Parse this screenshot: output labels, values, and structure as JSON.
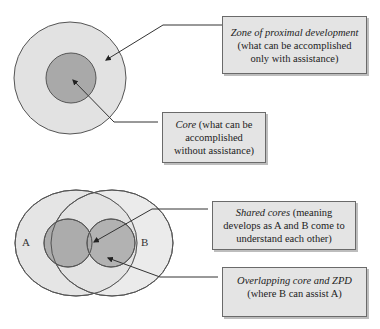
{
  "diagram": {
    "top": {
      "outer_circle_label": "Zone of proximal development",
      "inner_circle_label": "Core",
      "callouts": [
        {
          "term": "Zone of proximal development",
          "description": " (what can be accomplished only with assistance)"
        },
        {
          "term": "Core",
          "description": " (what can be accomplished without assistance)"
        }
      ]
    },
    "bottom": {
      "circle_labels": {
        "a": "A",
        "b": "B"
      },
      "callouts": [
        {
          "term": "Shared cores",
          "description": " (meaning develops as A and B come to understand each other)"
        },
        {
          "term": "Overlapping core and ZPD",
          "description": " (where B can assist A)"
        }
      ]
    },
    "colors": {
      "outer_fill": "#e2e2e2",
      "inner_fill": "#a9a9a9",
      "stroke": "#555555",
      "box_fill": "#e4e4e4"
    }
  }
}
